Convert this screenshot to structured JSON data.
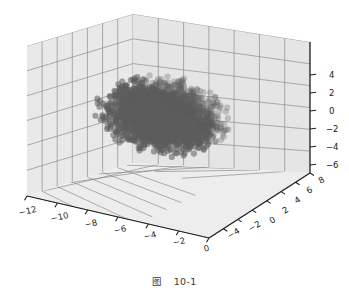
{
  "figure": {
    "caption_label": "图",
    "caption_number": "10-1",
    "background_color": "#ffffff",
    "pane_color": "#e8e8e8",
    "grid_color": "#8f8f8f",
    "axis_line_color": "#1e1e1e",
    "marker_color": "#5c5c5c",
    "marker_highlight_color": "#8d8d8d",
    "tick_text_color": "#1b1b1b"
  },
  "chart_data": {
    "type": "scatter",
    "projection": "3d",
    "title": "",
    "xlabel": "",
    "ylabel": "",
    "zlabel": "",
    "xlim": [
      -13,
      1
    ],
    "ylim": [
      -5,
      9
    ],
    "zlim": [
      -7,
      5
    ],
    "grid": true,
    "legend": null,
    "n_points": 3000,
    "cloud": {
      "center": [
        -6.2,
        1.6,
        -0.6
      ],
      "radii": [
        4.6,
        3.6,
        3.1
      ],
      "color": "#5c5c5c",
      "alpha": 0.55,
      "marker_size": 3.1
    },
    "xticks": [
      -12,
      -10,
      -8,
      -6,
      -4,
      -2,
      0
    ],
    "xticklabels": [
      "−12",
      "−10",
      "−8",
      "−6",
      "−4",
      "−2",
      "0"
    ],
    "yticks": [
      -4,
      -2,
      0,
      2,
      4,
      6,
      8
    ],
    "yticklabels": [
      "−4",
      "−2",
      "0",
      "2",
      "4",
      "6",
      "8"
    ],
    "zticks": [
      4,
      2,
      0,
      -2,
      -4,
      -6
    ],
    "zticklabels": [
      "4",
      "2",
      "0",
      "−2",
      "−4",
      "−6"
    ]
  },
  "xticks_layout": [
    {
      "label": "−12",
      "x": 18,
      "y": 209
    },
    {
      "label": "−10",
      "x": 50,
      "y": 215
    },
    {
      "label": "−8",
      "x": 84,
      "y": 221
    },
    {
      "label": "−6",
      "x": 113,
      "y": 227
    },
    {
      "label": "−4",
      "x": 143,
      "y": 233
    },
    {
      "label": "−2",
      "x": 172,
      "y": 239
    },
    {
      "label": "0",
      "x": 203,
      "y": 245
    }
  ],
  "yticks_layout": [
    {
      "label": "−4",
      "x": 226,
      "y": 233
    },
    {
      "label": "−2",
      "x": 247,
      "y": 226
    },
    {
      "label": "0",
      "x": 268,
      "y": 218
    },
    {
      "label": "2",
      "x": 281,
      "y": 208
    },
    {
      "label": "4",
      "x": 293,
      "y": 198
    },
    {
      "label": "6",
      "x": 305,
      "y": 188
    },
    {
      "label": "8",
      "x": 317,
      "y": 178
    }
  ],
  "zticks_layout": [
    {
      "label": "4",
      "x": 329,
      "y": 71
    },
    {
      "label": "2",
      "x": 329,
      "y": 89
    },
    {
      "label": "0",
      "x": 329,
      "y": 107
    },
    {
      "label": "−2",
      "x": 326,
      "y": 125
    },
    {
      "label": "−4",
      "x": 326,
      "y": 143
    },
    {
      "label": "−6",
      "x": 326,
      "y": 161
    }
  ]
}
